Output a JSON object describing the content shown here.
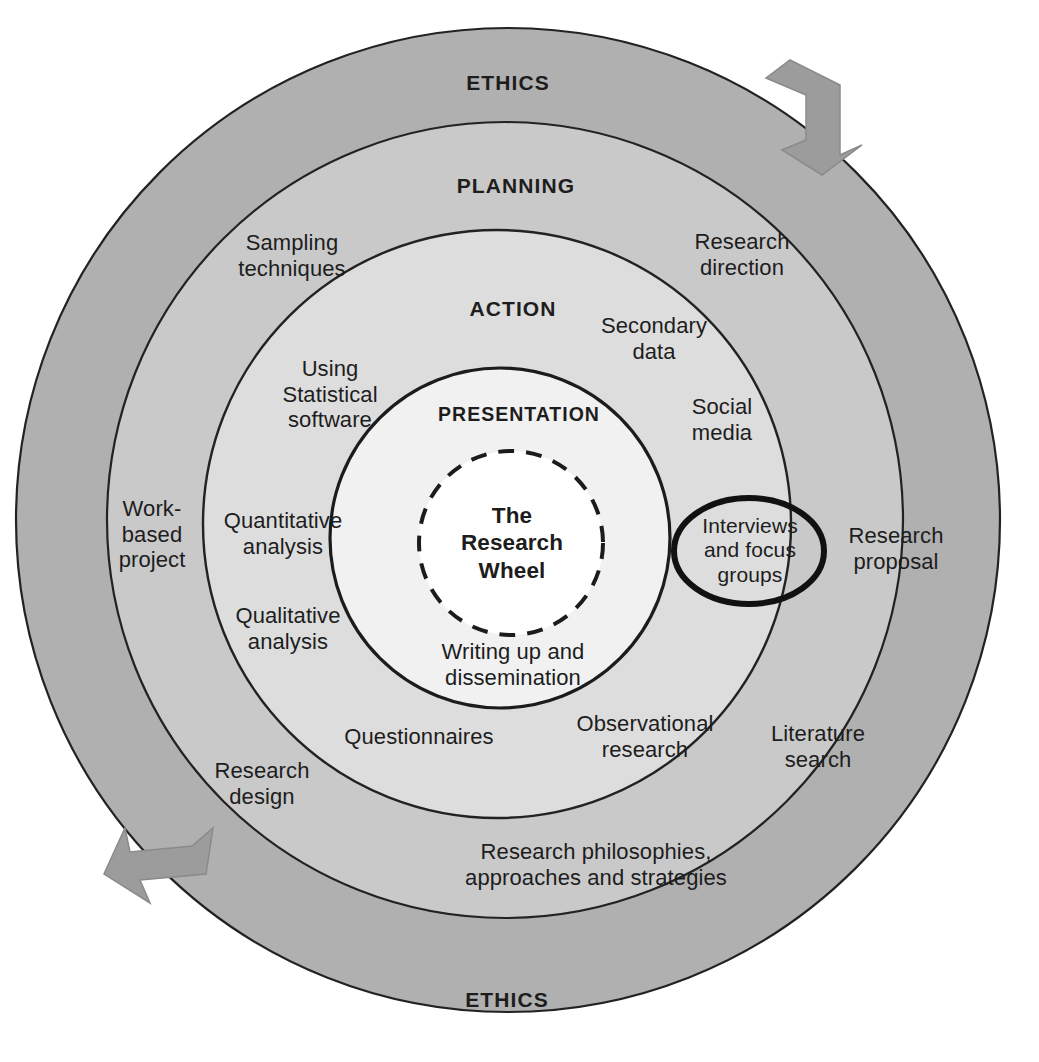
{
  "diagram": {
    "title": "The Research Wheel",
    "type": "concentric-ring-diagram",
    "colors": {
      "outer_ring": "#b0b0b0",
      "planning_ring": "#c8c8c8",
      "action_ring": "#dcdcdc",
      "presentation_ring": "#f0f0f0",
      "center": "#ffffff",
      "stroke": "#222222",
      "arrow_fill": "#9a9a9a",
      "text": "#1d1d1d"
    },
    "rings": [
      {
        "name": "ethics",
        "label_top": "ETHICS",
        "label_bottom": "ETHICS"
      },
      {
        "name": "planning",
        "label": "PLANNING"
      },
      {
        "name": "action",
        "label": "ACTION"
      },
      {
        "name": "presentation",
        "label": "PRESENTATION"
      }
    ],
    "center": {
      "line1": "The",
      "line2": "Research",
      "line3": "Wheel"
    },
    "planning_items": [
      {
        "id": "sampling-techniques",
        "line1": "Sampling",
        "line2": "techniques"
      },
      {
        "id": "research-direction",
        "line1": "Research",
        "line2": "direction"
      },
      {
        "id": "work-based-project",
        "line1": "Work-",
        "line2": "based",
        "line3": "project"
      },
      {
        "id": "research-proposal",
        "line1": "Research",
        "line2": "proposal"
      },
      {
        "id": "research-design",
        "line1": "Research",
        "line2": "design"
      },
      {
        "id": "literature-search",
        "line1": "Literature",
        "line2": "search"
      },
      {
        "id": "research-philosophies",
        "line1": "Research philosophies,",
        "line2": "approaches and strategies"
      }
    ],
    "action_items": [
      {
        "id": "using-statistical-software",
        "line1": "Using",
        "line2": "Statistical",
        "line3": "software"
      },
      {
        "id": "secondary-data",
        "line1": "Secondary",
        "line2": "data"
      },
      {
        "id": "social-media",
        "line1": "Social",
        "line2": "media"
      },
      {
        "id": "quantitative-analysis",
        "line1": "Quantitative",
        "line2": "analysis"
      },
      {
        "id": "qualitative-analysis",
        "line1": "Qualitative",
        "line2": "analysis"
      },
      {
        "id": "questionnaires",
        "line1": "Questionnaires"
      },
      {
        "id": "observational-research",
        "line1": "Observational",
        "line2": "research"
      },
      {
        "id": "interviews-and-focus-groups",
        "line1": "Interviews",
        "line2": "and focus",
        "line3": "groups",
        "highlighted": true
      }
    ],
    "presentation_items": [
      {
        "id": "writing-up-and-dissemination",
        "line1": "Writing up and",
        "line2": "dissemination"
      }
    ],
    "arrows": [
      {
        "id": "top-right-arrow",
        "direction": "clockwise"
      },
      {
        "id": "bottom-left-arrow",
        "direction": "clockwise"
      }
    ]
  }
}
